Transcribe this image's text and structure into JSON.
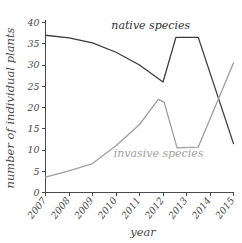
{
  "chart_data": {
    "type": "line",
    "title": "",
    "xlabel": "year",
    "ylabel": "number of individual plants",
    "xlim": [
      2007,
      2015
    ],
    "ylim": [
      0,
      40
    ],
    "grid": false,
    "legend_position": "inline-annotations",
    "x_tick_labels": [
      "2007",
      "2008",
      "2009",
      "2010",
      "2011",
      "2012",
      "2013",
      "2014",
      "2015"
    ],
    "y_tick_labels": [
      "0",
      "5",
      "10",
      "15",
      "20",
      "25",
      "30",
      "35",
      "40"
    ],
    "y_ticks": [
      0,
      5,
      10,
      15,
      20,
      25,
      30,
      35,
      40
    ],
    "series": [
      {
        "name": "native species",
        "color": "#3c3c3c",
        "label_color": "#2e2e2e",
        "x": [
          2007,
          2008,
          2009,
          2010,
          2011,
          2012,
          2012.55,
          2013.5,
          2015
        ],
        "values": [
          37,
          36.4,
          35.2,
          33,
          30,
          26,
          36.5,
          36.5,
          11.5
        ]
      },
      {
        "name": "invasive species",
        "color": "#9e9e9e",
        "label_color": "#a0a0a0",
        "x": [
          2007,
          2008,
          2009,
          2010,
          2011,
          2011.8,
          2012.05,
          2012.6,
          2013.5,
          2015
        ],
        "values": [
          3.6,
          5.1,
          6.8,
          11,
          16,
          21.9,
          21.2,
          10.5,
          10.7,
          30.5
        ]
      }
    ],
    "annotations": [
      {
        "text": "native species",
        "x": 2009.8,
        "y": 38.4,
        "color": "#2e2e2e",
        "anchor": "start"
      },
      {
        "text": "invasive species",
        "x": 2009.9,
        "y": 8.4,
        "color": "#a0a0a0",
        "anchor": "start"
      }
    ]
  }
}
